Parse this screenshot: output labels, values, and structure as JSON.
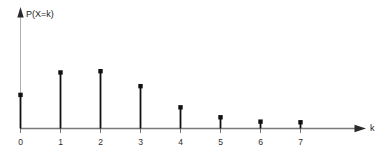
{
  "chart_data": {
    "type": "bar",
    "subtype": "stem-plot",
    "title": "",
    "subtitle": "",
    "xlabel": "k",
    "ylabel": "P(X=k)",
    "categories": [
      "0",
      "1",
      "2",
      "3",
      "4",
      "5",
      "6",
      "7"
    ],
    "x": [
      0,
      1,
      2,
      3,
      4,
      5,
      6,
      7
    ],
    "values": [
      0.27,
      0.45,
      0.46,
      0.34,
      0.17,
      0.09,
      0.055,
      0.05
    ],
    "tick_labels": [
      "0",
      "1",
      "2",
      "3",
      "4",
      "5",
      "6",
      "7"
    ],
    "xlim": [
      0,
      7
    ],
    "ylim": [
      0,
      0.55
    ],
    "grid": false,
    "legend": null,
    "legend_position": "none",
    "annotations": [],
    "axis_arrows": true,
    "marker": "filled-square-dot",
    "series": [
      {
        "name": "P(X=k)",
        "values": [
          0.27,
          0.45,
          0.46,
          0.34,
          0.17,
          0.09,
          0.055,
          0.05
        ]
      }
    ]
  },
  "style": {
    "stem_color": "#111111",
    "marker_color": "#111111",
    "x_axis_color": "#7a7a7a",
    "y_axis_color": "#b0b0b0",
    "tick_color": "#7a7a7a",
    "background": "#ffffff"
  },
  "labels": {
    "y_axis": "P(X=k)",
    "x_axis": "k"
  }
}
